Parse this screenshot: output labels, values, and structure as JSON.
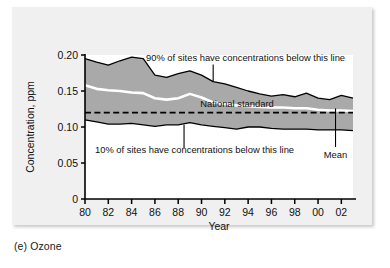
{
  "figure": {
    "caption": "(e) Ozone",
    "panel_bg": "#f0f0f0",
    "band_fill": "#a9a9a9",
    "mean_line_color": "#ffffff",
    "standard_line_color": "#000000"
  },
  "chart_data": {
    "type": "area",
    "title": "",
    "subtitle": "",
    "xlabel": "Year",
    "ylabel": "Concentration, ppm",
    "xlim": [
      1980,
      2003
    ],
    "ylim": [
      0,
      0.2
    ],
    "grid": false,
    "legend_position": "none",
    "ytick_labels": [
      "0.20",
      "0.15",
      "0.10",
      "0.05",
      "0"
    ],
    "ytick_values": [
      0.2,
      0.15,
      0.1,
      0.05,
      0
    ],
    "xtick_labels": [
      "80",
      "82",
      "84",
      "86",
      "88",
      "90",
      "92",
      "94",
      "96",
      "98",
      "00",
      "02"
    ],
    "xtick_values": [
      1980,
      1982,
      1984,
      1986,
      1988,
      1990,
      1992,
      1994,
      1996,
      1998,
      2000,
      2002
    ],
    "x": [
      1980,
      1981,
      1982,
      1983,
      1984,
      1985,
      1986,
      1987,
      1988,
      1989,
      1990,
      1991,
      1992,
      1993,
      1994,
      1995,
      1996,
      1997,
      1998,
      1999,
      2000,
      2001,
      2002,
      2003
    ],
    "series": [
      {
        "name": "90% of sites have concentrations below this line",
        "values": [
          0.195,
          0.19,
          0.186,
          0.192,
          0.197,
          0.195,
          0.172,
          0.169,
          0.174,
          0.178,
          0.172,
          0.163,
          0.16,
          0.155,
          0.15,
          0.146,
          0.143,
          0.145,
          0.142,
          0.147,
          0.14,
          0.138,
          0.144,
          0.14
        ]
      },
      {
        "name": "Mean",
        "values": [
          0.158,
          0.153,
          0.151,
          0.15,
          0.148,
          0.147,
          0.14,
          0.138,
          0.14,
          0.146,
          0.141,
          0.134,
          0.132,
          0.13,
          0.129,
          0.128,
          0.127,
          0.127,
          0.126,
          0.126,
          0.124,
          0.123,
          0.123,
          0.122
        ]
      },
      {
        "name": "10% of sites have concentrations below this line",
        "values": [
          0.11,
          0.107,
          0.104,
          0.104,
          0.105,
          0.103,
          0.101,
          0.103,
          0.103,
          0.106,
          0.103,
          0.101,
          0.099,
          0.097,
          0.1,
          0.1,
          0.098,
          0.097,
          0.097,
          0.097,
          0.096,
          0.096,
          0.096,
          0.095
        ]
      },
      {
        "name": "National standard",
        "values": [
          0.12,
          0.12,
          0.12,
          0.12,
          0.12,
          0.12,
          0.12,
          0.12,
          0.12,
          0.12,
          0.12,
          0.12,
          0.12,
          0.12,
          0.12,
          0.12,
          0.12,
          0.12,
          0.12,
          0.12,
          0.12,
          0.12,
          0.12,
          0.12
        ]
      }
    ],
    "annotations": [
      {
        "text": "90% of sites have concentrations below this line",
        "anchor_year": 1991,
        "anchor_value": 0.163
      },
      {
        "text": "10% of sites have concentrations below this line",
        "anchor_year": 1988.5,
        "anchor_value": 0.103
      },
      {
        "text": "National standard",
        "anchor_year": 1993,
        "anchor_value": 0.12
      },
      {
        "text": "Mean",
        "anchor_year": 2001.5,
        "anchor_value": 0.123
      }
    ]
  }
}
